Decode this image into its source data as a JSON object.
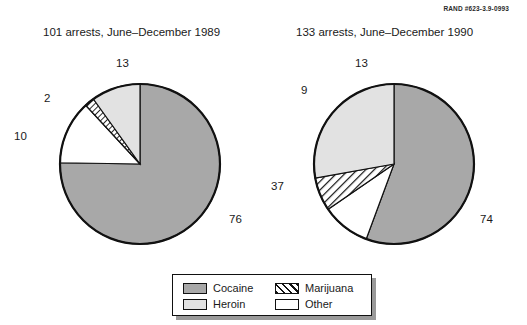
{
  "figure": {
    "rand_id": "RAND #623-3.9-0993"
  },
  "legend": {
    "items": [
      {
        "label": "Cocaine",
        "key": "cocaine",
        "color": "#a8a8a8",
        "pattern": "solid"
      },
      {
        "label": "Heroin",
        "key": "heroin",
        "color": "#e2e2e2",
        "pattern": "solid"
      },
      {
        "label": "Marijuana",
        "key": "marijuana",
        "color": "#ffffff",
        "pattern": "hatch"
      },
      {
        "label": "Other",
        "key": "other",
        "color": "#ffffff",
        "pattern": "solid"
      }
    ]
  },
  "chart_data": [
    {
      "type": "pie",
      "id": "pie-1989",
      "title": "101 arrests, June–December 1989",
      "total": 101,
      "unit": "arrests",
      "start_angle_deg": 0,
      "direction": "clockwise",
      "categories": [
        "Cocaine",
        "Other",
        "Marijuana",
        "Heroin"
      ],
      "values": [
        76,
        13,
        2,
        10
      ],
      "labels": [
        "76",
        "13",
        "2",
        "10"
      ],
      "colors": [
        "#a8a8a8",
        "#ffffff",
        "#ffffff",
        "#e2e2e2"
      ],
      "patterns": [
        "solid",
        "solid",
        "hatch",
        "solid"
      ],
      "center": {
        "x": 140,
        "y": 164
      },
      "radius": 80,
      "label_positions": [
        {
          "text": "76",
          "x": 229,
          "y": 213
        },
        {
          "text": "13",
          "x": 116,
          "y": 57
        },
        {
          "text": "2",
          "x": 44,
          "y": 92
        },
        {
          "text": "10",
          "x": 14,
          "y": 130
        }
      ]
    },
    {
      "type": "pie",
      "id": "pie-1990",
      "title": "133 arrests, June–December 1990",
      "total": 133,
      "unit": "arrests",
      "start_angle_deg": 0,
      "direction": "clockwise",
      "categories": [
        "Cocaine",
        "Other",
        "Marijuana",
        "Heroin"
      ],
      "values": [
        74,
        13,
        9,
        37
      ],
      "labels": [
        "74",
        "13",
        "9",
        "37"
      ],
      "colors": [
        "#a8a8a8",
        "#ffffff",
        "#ffffff",
        "#e2e2e2"
      ],
      "patterns": [
        "solid",
        "solid",
        "hatch",
        "solid"
      ],
      "center": {
        "x": 394,
        "y": 164
      },
      "radius": 80,
      "label_positions": [
        {
          "text": "74",
          "x": 480,
          "y": 213
        },
        {
          "text": "13",
          "x": 355,
          "y": 57
        },
        {
          "text": "9",
          "x": 301,
          "y": 84
        },
        {
          "text": "37",
          "x": 271,
          "y": 180
        }
      ]
    }
  ]
}
